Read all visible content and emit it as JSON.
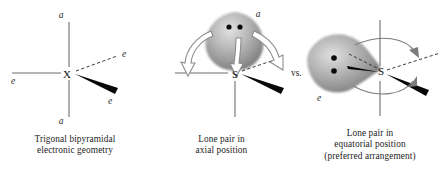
{
  "figure": {
    "comparison_label": "vs.",
    "colors": {
      "lobe_gray_light": "#d8d8d8",
      "lobe_gray_mid": "#a8a8a8",
      "lobe_gray_dark": "#6f6f6f",
      "bond_gray": "#6e6e6e",
      "wedge_black": "#080808",
      "arrow_gray": "#8a8a8a",
      "text_black": "#1c1c1c",
      "background": "#ffffff"
    }
  },
  "panels": [
    {
      "id": "trigonal-bipyramidal",
      "center_atom": "X",
      "position_labels": {
        "axial_top": "a",
        "axial_bottom": "a",
        "equatorial_left": "e",
        "equatorial_dashed": "e",
        "equatorial_wedge": "e"
      },
      "caption_lines": [
        "Trigonal bipyramidal",
        "electronic geometry"
      ]
    },
    {
      "id": "lone-pair-axial",
      "center_atom": "S",
      "position_labels": {
        "axial_top": "a",
        "equatorial_left": "",
        "equatorial_dashed": "",
        "equatorial_wedge": ""
      },
      "lone_pair": {
        "position": "axial",
        "electron_dots": 2,
        "repulsion_arrows": 3
      },
      "caption_lines": [
        "Lone pair in",
        "axial position"
      ]
    },
    {
      "id": "lone-pair-equatorial",
      "center_atom": "S",
      "position_labels": {
        "equatorial_lone_pair": "e"
      },
      "lone_pair": {
        "position": "equatorial",
        "electron_dots": 2,
        "repulsion_arrows": 2
      },
      "caption_lines": [
        "Lone pair in",
        "equatorial position",
        "(preferred arrangement)"
      ]
    }
  ]
}
